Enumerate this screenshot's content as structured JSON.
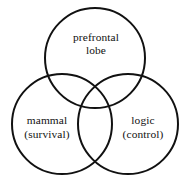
{
  "diagram": {
    "type": "venn",
    "title": "",
    "canvas": {
      "width": 190,
      "height": 183,
      "background": "#ffffff"
    },
    "style": {
      "stroke_color": "#111111",
      "stroke_width": 2,
      "fill": "none",
      "text_color": "#111111"
    },
    "sets": [
      {
        "id": "prefrontal",
        "name": "prefrontal-lobe-circle",
        "label_line1": "prefrontal",
        "label_line2": "lobe",
        "cx": 95,
        "cy": 58,
        "r": 50,
        "label_x": 96,
        "label_y1": 41,
        "label_y2": 54
      },
      {
        "id": "mammal",
        "name": "mammal-survival-circle",
        "label_line1": "mammal",
        "label_line2": "(survival)",
        "cx": 62,
        "cy": 124,
        "r": 50,
        "label_x": 47,
        "label_y1": 124,
        "label_y2": 138
      },
      {
        "id": "logic",
        "name": "logic-control-circle",
        "label_line1": "logic",
        "label_line2": "(control)",
        "cx": 128,
        "cy": 124,
        "r": 50,
        "label_x": 143,
        "label_y1": 124,
        "label_y2": 138
      }
    ]
  }
}
